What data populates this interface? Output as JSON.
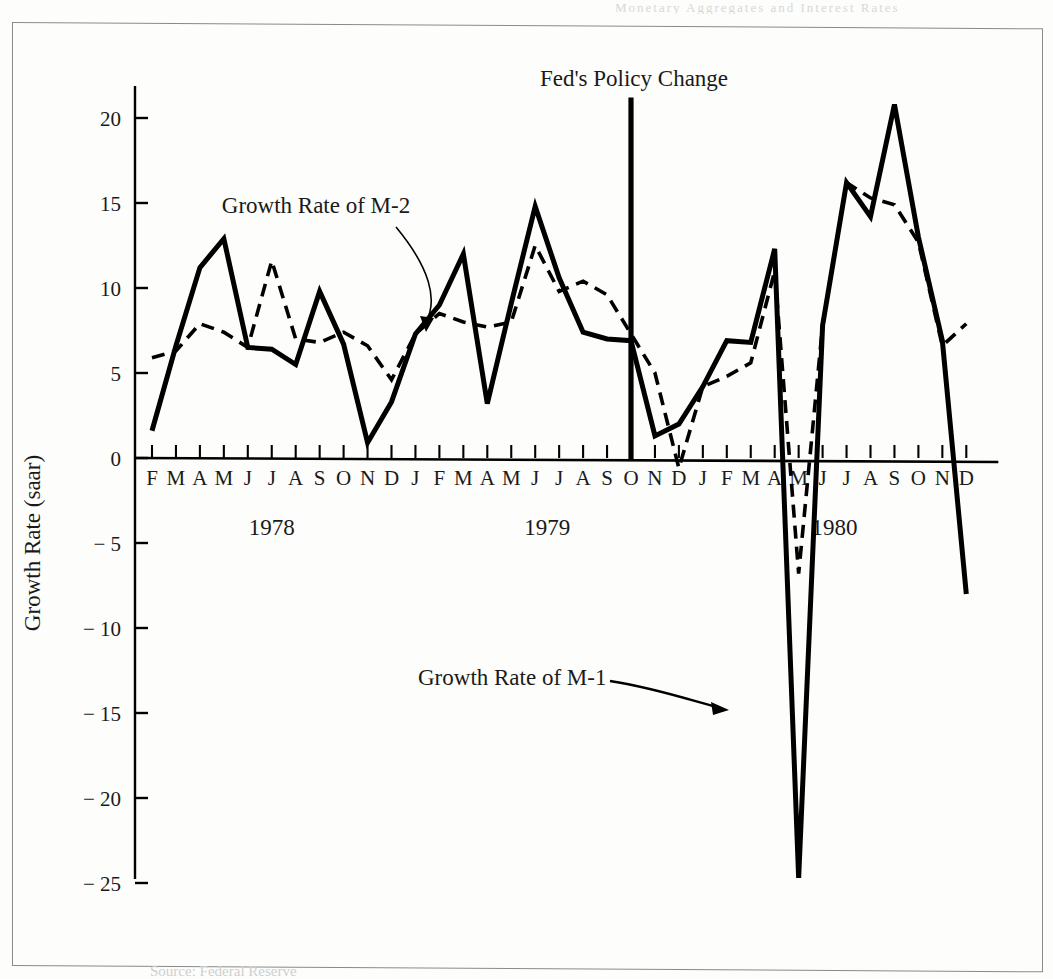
{
  "figure": {
    "bleed_text": "Monetary Aggregates and Interest Rates",
    "source_note": "Source: Federal Reserve"
  },
  "annotations": {
    "fed_policy": "Fed's Policy Change",
    "m2_label": "Growth Rate of M-2",
    "m1_label": "Growth Rate of M-1"
  },
  "axis": {
    "ylabel": "Growth Rate (saar)",
    "yticks": [
      "20",
      "15",
      "10",
      "5",
      "0",
      "− 5",
      "− 10",
      "− 15",
      "− 20",
      "− 25"
    ],
    "year_labels": [
      "1978",
      "1979",
      "1980"
    ]
  },
  "chart_data": {
    "type": "line",
    "title": "",
    "xlabel": "",
    "ylabel": "Growth Rate (saar)",
    "ylim": [
      -27,
      22
    ],
    "yticks": [
      20,
      15,
      10,
      5,
      0,
      -5,
      -10,
      -15,
      -20,
      -25
    ],
    "grid": false,
    "legend": "annotated-inline",
    "x": [
      "F",
      "M",
      "A",
      "M",
      "J",
      "J",
      "A",
      "S",
      "O",
      "N",
      "D",
      "J",
      "F",
      "M",
      "A",
      "M",
      "J",
      "J",
      "A",
      "S",
      "O",
      "N",
      "D",
      "J",
      "F",
      "M",
      "A",
      "M",
      "J",
      "J",
      "A",
      "S",
      "O",
      "N",
      "D"
    ],
    "x_full": [
      "1978-02",
      "1978-03",
      "1978-04",
      "1978-05",
      "1978-06",
      "1978-07",
      "1978-08",
      "1978-09",
      "1978-10",
      "1978-11",
      "1978-12",
      "1979-01",
      "1979-02",
      "1979-03",
      "1979-04",
      "1979-05",
      "1979-06",
      "1979-07",
      "1979-08",
      "1979-09",
      "1979-10",
      "1979-11",
      "1979-12",
      "1980-01",
      "1980-02",
      "1980-03",
      "1980-04",
      "1980-05",
      "1980-06",
      "1980-07",
      "1980-08",
      "1980-09",
      "1980-10",
      "1980-11",
      "1980-12"
    ],
    "year_spans": [
      {
        "label": "1978",
        "start_index": 0,
        "end_index": 10
      },
      {
        "label": "1979",
        "start_index": 11,
        "end_index": 22
      },
      {
        "label": "1980",
        "start_index": 23,
        "end_index": 34
      }
    ],
    "series": [
      {
        "name": "Growth Rate of M-1",
        "style": "solid",
        "color": "#000000",
        "values": [
          1.6,
          6.6,
          11.2,
          12.9,
          6.5,
          6.4,
          5.5,
          9.8,
          6.7,
          0.9,
          3.3,
          7.3,
          9.0,
          12.0,
          3.2,
          9.1,
          14.8,
          10.6,
          7.4,
          7.0,
          6.9,
          1.3,
          2.0,
          4.2,
          6.9,
          6.8,
          12.3,
          -24.7,
          7.8,
          16.2,
          14.2,
          20.8,
          13.0,
          6.9,
          -8.0
        ]
      },
      {
        "name": "Growth Rate of M-2",
        "style": "dashed",
        "color": "#000000",
        "values": [
          5.9,
          6.3,
          7.9,
          7.4,
          6.5,
          11.6,
          7.0,
          6.8,
          7.4,
          6.6,
          4.6,
          7.3,
          8.5,
          8.0,
          7.7,
          8.0,
          12.5,
          9.8,
          10.4,
          9.6,
          7.3,
          5.0,
          -0.6,
          4.2,
          4.8,
          5.6,
          11.0,
          -6.8,
          7.8,
          16.2,
          15.3,
          14.9,
          12.7,
          6.6,
          7.9
        ]
      }
    ],
    "event_markers": [
      {
        "label": "Fed's Policy Change",
        "at_index": 20,
        "top_value": 21.2
      }
    ]
  },
  "colors": {
    "ink": "#000000",
    "frame": "#8a8a8a",
    "paper": "#fdfdfb"
  }
}
